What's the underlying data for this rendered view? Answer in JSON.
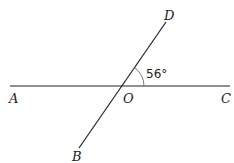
{
  "diagram": {
    "points": {
      "A": "A",
      "B": "B",
      "C": "C",
      "D": "D",
      "O": "O"
    },
    "angle_label": "56°",
    "angle_between": [
      "OD",
      "OC"
    ],
    "angle_value_deg": 56,
    "lines": [
      "AC",
      "BD"
    ],
    "stroke_color": "#222222"
  }
}
